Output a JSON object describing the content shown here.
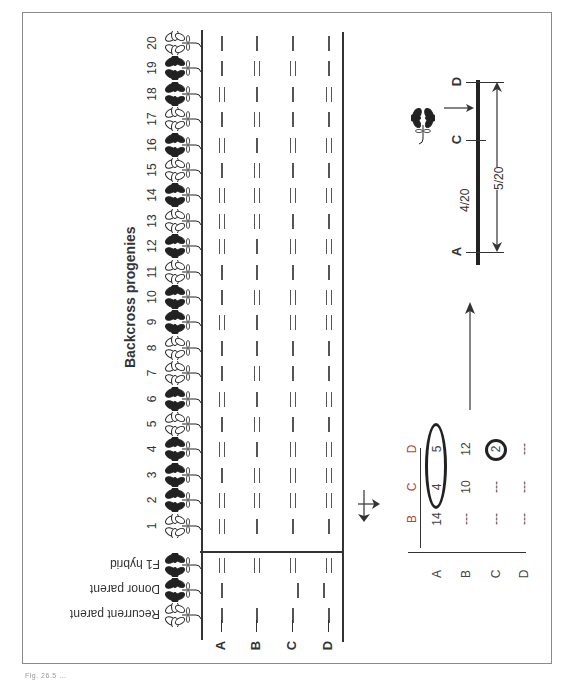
{
  "figure": {
    "section_title": "Backcross progenies",
    "parents": [
      {
        "label": "F1 hybrid",
        "phenotype": "black",
        "bands": {
          "A": 2,
          "B": 2,
          "C": 2,
          "D": 2
        }
      },
      {
        "label": "Donor parent",
        "phenotype": "black",
        "bands": {
          "A": 1,
          "B": 0,
          "C": 1,
          "D": 1
        }
      },
      {
        "label": "Recurrent parent",
        "phenotype": "white",
        "bands": {
          "A": 1,
          "B": 1,
          "C": 1,
          "D": 1
        }
      }
    ],
    "markers": [
      "A",
      "B",
      "C",
      "D"
    ],
    "progenies": [
      {
        "n": "1",
        "phenotype": "white",
        "bands": [
          2,
          1,
          1,
          1
        ]
      },
      {
        "n": "2",
        "phenotype": "black",
        "bands": [
          2,
          2,
          2,
          2
        ]
      },
      {
        "n": "3",
        "phenotype": "black",
        "bands": [
          1,
          2,
          2,
          2
        ]
      },
      {
        "n": "4",
        "phenotype": "black",
        "bands": [
          2,
          1,
          2,
          2
        ]
      },
      {
        "n": "5",
        "phenotype": "white",
        "bands": [
          1,
          2,
          1,
          1
        ]
      },
      {
        "n": "6",
        "phenotype": "black",
        "bands": [
          2,
          1,
          2,
          2
        ]
      },
      {
        "n": "7",
        "phenotype": "white",
        "bands": [
          1,
          2,
          1,
          1
        ]
      },
      {
        "n": "8",
        "phenotype": "white",
        "bands": [
          1,
          1,
          1,
          1
        ]
      },
      {
        "n": "9",
        "phenotype": "black",
        "bands": [
          2,
          1,
          2,
          2
        ]
      },
      {
        "n": "10",
        "phenotype": "black",
        "bands": [
          1,
          2,
          2,
          2
        ]
      },
      {
        "n": "11",
        "phenotype": "white",
        "bands": [
          1,
          1,
          1,
          1
        ]
      },
      {
        "n": "12",
        "phenotype": "black",
        "bands": [
          2,
          1,
          2,
          2
        ]
      },
      {
        "n": "13",
        "phenotype": "white",
        "bands": [
          2,
          2,
          1,
          1
        ]
      },
      {
        "n": "14",
        "phenotype": "black",
        "bands": [
          2,
          2,
          2,
          2
        ]
      },
      {
        "n": "15",
        "phenotype": "white",
        "bands": [
          1,
          2,
          1,
          1
        ]
      },
      {
        "n": "16",
        "phenotype": "black",
        "bands": [
          2,
          1,
          2,
          2
        ]
      },
      {
        "n": "17",
        "phenotype": "white",
        "bands": [
          1,
          2,
          1,
          1
        ]
      },
      {
        "n": "18",
        "phenotype": "black",
        "bands": [
          2,
          1,
          1,
          2
        ]
      },
      {
        "n": "19",
        "phenotype": "black",
        "bands": [
          1,
          2,
          2,
          1
        ]
      },
      {
        "n": "20",
        "phenotype": "white",
        "bands": [
          1,
          1,
          1,
          1
        ]
      }
    ],
    "recombination_table": {
      "col_headers": [
        "B",
        "C",
        "D"
      ],
      "row_headers": [
        "A",
        "B",
        "C",
        "D"
      ],
      "rows": [
        [
          "14",
          "4",
          "5"
        ],
        [
          "---",
          "10",
          "12"
        ],
        [
          "---",
          "---",
          "2"
        ],
        [
          "---",
          "---",
          "---"
        ]
      ],
      "highlight_ellipse": [
        "A-C: 4",
        "A-D: 5"
      ],
      "highlight_circle": "C-D: 2"
    },
    "linkage_map": {
      "loci": [
        "A",
        "C",
        "D"
      ],
      "distance_A_C": "4/20",
      "distance_A_D": "5/20",
      "trait_marker": "flower-trait-gene"
    },
    "caption": "Fig. 26.5 ..."
  },
  "colors": {
    "ink": "#333333",
    "frame": "#8a8a8a",
    "table_header": "#b0453a",
    "highlight_circle": "#222222"
  }
}
